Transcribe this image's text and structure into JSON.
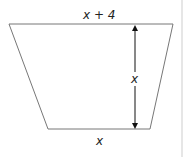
{
  "figure": {
    "shape": "trapezoid",
    "top_label": "x + 4",
    "height_label": "x",
    "bottom_label": "x",
    "stroke_color": "#777777",
    "arrow_color": "#111111"
  }
}
